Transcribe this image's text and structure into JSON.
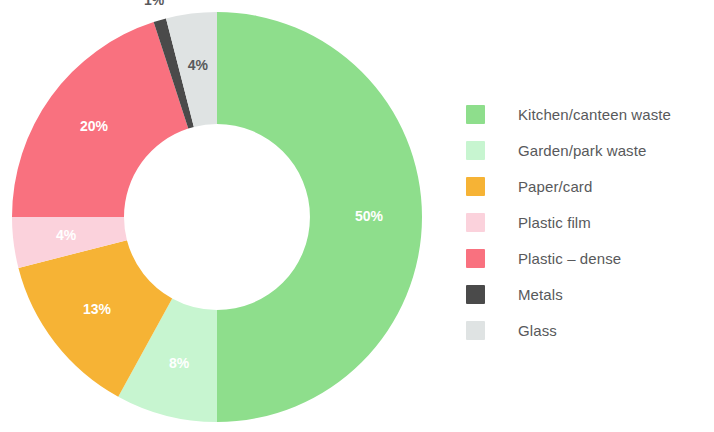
{
  "chart_data": {
    "type": "pie",
    "variant": "donut",
    "title": "",
    "subtitle": "",
    "xlabel": "",
    "ylabel": "",
    "grid": false,
    "legend_position": "right",
    "value_suffix": "%",
    "start_angle_deg": 0,
    "direction": "clockwise",
    "categories": [
      "Kitchen/canteen waste",
      "Garden/park waste",
      "Paper/card",
      "Plastic film",
      "Plastic – dense",
      "Metals",
      "Glass"
    ],
    "values": [
      50,
      8,
      13,
      4,
      20,
      1,
      4
    ],
    "labels": [
      "50%",
      "8%",
      "13%",
      "4%",
      "20%",
      "1%",
      "4%"
    ],
    "colors": [
      "#8ede8c",
      "#c7f5d0",
      "#f6b335",
      "#fbd2dc",
      "#f9717f",
      "#4a4a4a",
      "#dfe3e3"
    ],
    "label_colors": [
      "#ffffff",
      "#ffffff",
      "#ffffff",
      "#ffffff",
      "#ffffff",
      "#58595b",
      "#58595b"
    ],
    "label_placement": [
      "inside",
      "inside",
      "inside",
      "inside",
      "inside",
      "outside",
      "inside"
    ],
    "slices": [
      {
        "name": "Kitchen/canteen waste",
        "value": 50,
        "label": "50%",
        "color": "#8ede8c"
      },
      {
        "name": "Garden/park waste",
        "value": 8,
        "label": "8%",
        "color": "#c7f5d0"
      },
      {
        "name": "Paper/card",
        "value": 13,
        "label": "13%",
        "color": "#f6b335"
      },
      {
        "name": "Plastic film",
        "value": 4,
        "label": "4%",
        "color": "#fbd2dc"
      },
      {
        "name": "Plastic – dense",
        "value": 20,
        "label": "20%",
        "color": "#f9717f"
      },
      {
        "name": "Metals",
        "value": 1,
        "label": "1%",
        "color": "#4a4a4a"
      },
      {
        "name": "Glass",
        "value": 4,
        "label": "4%",
        "color": "#dfe3e3"
      }
    ]
  },
  "legend": {
    "items": [
      {
        "label": "Kitchen/canteen waste",
        "color": "#8ede8c"
      },
      {
        "label": "Garden/park waste",
        "color": "#c7f5d0"
      },
      {
        "label": "Paper/card",
        "color": "#f6b335"
      },
      {
        "label": "Plastic film",
        "color": "#fbd2dc"
      },
      {
        "label": "Plastic – dense",
        "color": "#f9717f"
      },
      {
        "label": "Metals",
        "color": "#4a4a4a"
      },
      {
        "label": "Glass",
        "color": "#dfe3e3"
      }
    ]
  },
  "geometry": {
    "center_x": 217,
    "center_y": 217,
    "outer_radius": 205,
    "inner_radius": 93,
    "label_radius": 152,
    "outside_label_radius": 225
  }
}
